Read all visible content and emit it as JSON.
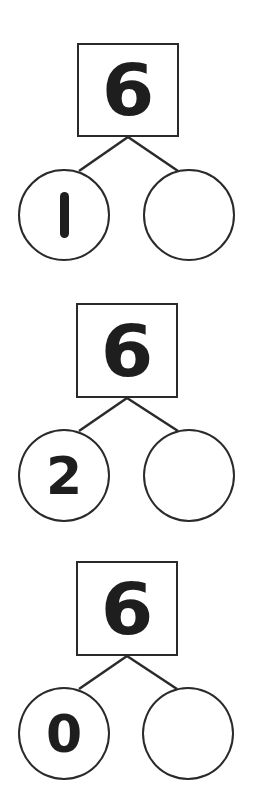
{
  "colors": {
    "stroke": "#2a2a2a",
    "text": "#1e1e1e",
    "background": "#ffffff"
  },
  "bonds": [
    {
      "whole": "6",
      "parts": [
        "1",
        ""
      ],
      "layout": {
        "box": {
          "x": 77,
          "y": 43,
          "w": 102,
          "h": 94
        },
        "apex": {
          "x": 128,
          "y": 137
        },
        "left_circle": {
          "cx": 64,
          "cy": 215,
          "r": 46
        },
        "right_circle": {
          "cx": 189,
          "cy": 215,
          "r": 46
        }
      }
    },
    {
      "whole": "6",
      "parts": [
        "2",
        ""
      ],
      "layout": {
        "box": {
          "x": 76,
          "y": 303,
          "w": 102,
          "h": 94
        },
        "apex": {
          "x": 127,
          "y": 398
        },
        "left_circle": {
          "cx": 64,
          "cy": 475,
          "r": 46
        },
        "right_circle": {
          "cx": 189,
          "cy": 475,
          "r": 46
        }
      }
    },
    {
      "whole": "6",
      "parts": [
        "0",
        ""
      ],
      "layout": {
        "box": {
          "x": 76,
          "y": 561,
          "w": 102,
          "h": 95
        },
        "apex": {
          "x": 127,
          "y": 656
        },
        "left_circle": {
          "cx": 64,
          "cy": 733,
          "r": 46
        },
        "right_circle": {
          "cx": 188,
          "cy": 733,
          "r": 46
        }
      }
    }
  ]
}
